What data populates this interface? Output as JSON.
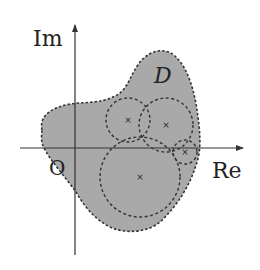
{
  "diagram": {
    "axes": {
      "x_label": "Re",
      "y_label": "Im",
      "origin_label": "O"
    },
    "region": {
      "label": "D",
      "fill": "#a9a9a9",
      "border": "dashed"
    },
    "circles": [
      {
        "id": "c1",
        "cx": 128,
        "cy": 132,
        "r": 24
      },
      {
        "id": "c2",
        "cx": 166,
        "cy": 126,
        "r": 27
      },
      {
        "id": "c3",
        "cx": 140,
        "cy": 177,
        "r": 40
      },
      {
        "id": "c4",
        "cx": 185,
        "cy": 152,
        "r": 12
      }
    ],
    "center_marker": "×",
    "colors": {
      "axis": "#333333",
      "dash": "#333333",
      "text": "#222222",
      "background": "#ffffff"
    }
  }
}
